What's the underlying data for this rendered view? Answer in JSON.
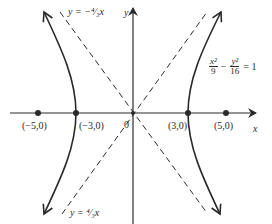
{
  "diagram": {
    "type": "hyperbola-graph",
    "equation": {
      "term1_num": "x²",
      "term1_den": "9",
      "minus": "−",
      "term2_num": "y²",
      "term2_den": "16",
      "equals": "= 1"
    },
    "asymptotes": {
      "upper_label": "y = −⁴⁄₃x",
      "lower_label": "y = ⁴⁄₃x"
    },
    "axes": {
      "x_label": "x",
      "y_label": "y",
      "origin_label": "0"
    },
    "points": [
      {
        "label": "(−5,0)",
        "x": -5,
        "role": "focus"
      },
      {
        "label": "(−3,0)",
        "x": -3,
        "role": "vertex"
      },
      {
        "label": "(3,0)",
        "x": 3,
        "role": "vertex"
      },
      {
        "label": "(5,0)",
        "x": 5,
        "role": "focus"
      }
    ],
    "colors": {
      "ink": "#2a2a2a",
      "background": "#ffffff"
    }
  }
}
